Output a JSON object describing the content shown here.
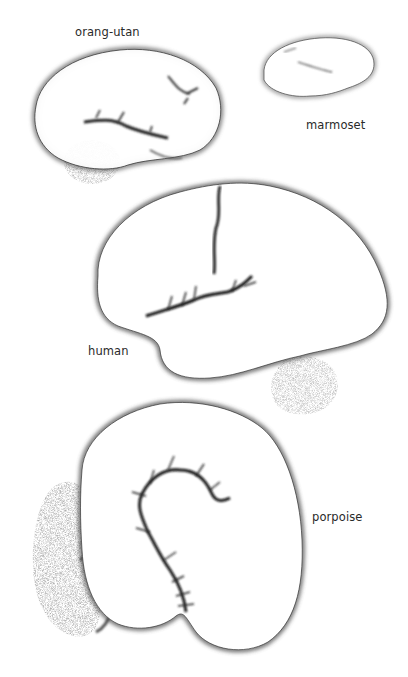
{
  "figure": {
    "labels": {
      "orangutan": "orang-utan",
      "marmoset": "marmoset",
      "human": "human",
      "porpoise": "porpoise"
    },
    "colors": {
      "ink": "#1a1a1a",
      "paper": "#ffffff"
    }
  }
}
